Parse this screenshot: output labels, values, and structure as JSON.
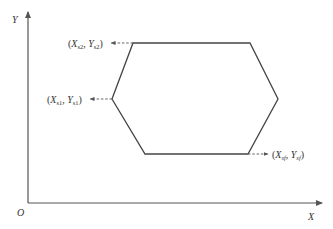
{
  "diagram": {
    "type": "coordinate-plot-hexagon",
    "axes": {
      "x_label": "X",
      "y_label": "Y",
      "origin_label": "O"
    },
    "points": [
      {
        "id": "s2",
        "x_sym": "X",
        "x_sub": "s2",
        "y_sym": "Y",
        "y_sub": "s2",
        "position": "top-left vertex",
        "arrow_direction": "left"
      },
      {
        "id": "s1",
        "x_sym": "X",
        "x_sub": "s1",
        "y_sym": "Y",
        "y_sub": "s1",
        "position": "left vertex",
        "arrow_direction": "left"
      },
      {
        "id": "sf",
        "x_sym": "X",
        "x_sub": "sf",
        "y_sym": "Y",
        "y_sub": "sf",
        "position": "bottom-right vertex",
        "arrow_direction": "right"
      }
    ],
    "punctuation": {
      "open": "(",
      "sep": ",  ",
      "close": ")"
    },
    "colors": {
      "line": "#444444",
      "axis": "#555555",
      "text": "#333333",
      "background": "#ffffff"
    }
  }
}
